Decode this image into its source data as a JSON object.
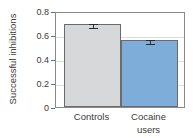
{
  "chart_data": {
    "type": "bar",
    "title": "",
    "subtitle": "",
    "xlabel": "",
    "ylabel": "Successful inhibitions",
    "categories": [
      "Controls",
      "Cocaine users"
    ],
    "category_lines": [
      [
        "Controls"
      ],
      [
        "Cocaine",
        "users"
      ]
    ],
    "values": [
      0.69,
      0.56
    ],
    "errors": [
      0.015,
      0.015
    ],
    "bar_colors": [
      "#d6d8da",
      "#7fadda"
    ],
    "bar_edge_color": "#6b6b6b",
    "error_bar_color": "#2b2b2b",
    "ylim": [
      0,
      0.8
    ],
    "yticks": [
      0,
      0.2,
      0.4,
      0.6,
      0.8
    ],
    "ytick_labels": [
      "0",
      "0.2",
      "0.4",
      "0.6",
      "0.8"
    ],
    "grid": true,
    "grid_axis": "y",
    "legend": false,
    "legend_position": "none",
    "frame": true,
    "annotations": []
  }
}
